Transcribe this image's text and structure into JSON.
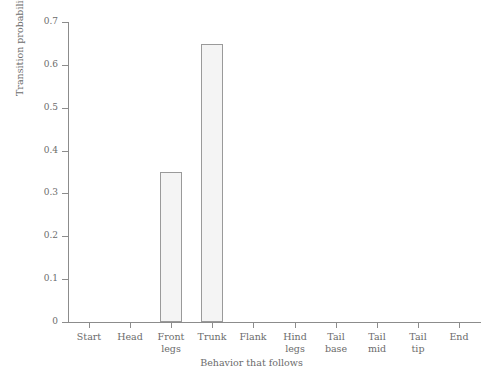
{
  "chart_data": {
    "type": "bar",
    "title": "",
    "xlabel": "Behavior that follows",
    "ylabel": "Transition probability",
    "categories": [
      "Start",
      "Head",
      "Front legs",
      "Trunk",
      "Flank",
      "Hind legs",
      "Tail base",
      "Tail mid",
      "Tail tip",
      "End"
    ],
    "category_lines": [
      [
        "Start"
      ],
      [
        "Head"
      ],
      [
        "Front",
        "legs"
      ],
      [
        "Trunk"
      ],
      [
        "Flank"
      ],
      [
        "Hind",
        "legs"
      ],
      [
        "Tail",
        "base"
      ],
      [
        "Tail",
        "mid"
      ],
      [
        "Tail",
        "tip"
      ],
      [
        "End"
      ]
    ],
    "values": [
      0,
      0,
      0.35,
      0.648,
      0,
      0,
      0,
      0,
      0,
      0
    ],
    "ylim": [
      0,
      0.7
    ],
    "ytick_labels": [
      "0",
      "0.1",
      "0.2",
      "0.3",
      "0.4",
      "0.5",
      "0.6",
      "0.7"
    ],
    "ytick_values": [
      0,
      0.1,
      0.2,
      0.3,
      0.4,
      0.5,
      0.6,
      0.7
    ],
    "grid": false,
    "legend": null,
    "bar_fill_color": "#f4f4f4",
    "bar_edge_color": "#9a9a9a",
    "axis_color": "#8c8c8c",
    "text_color": "#6b6b6b",
    "background_color": "#ffffff"
  }
}
